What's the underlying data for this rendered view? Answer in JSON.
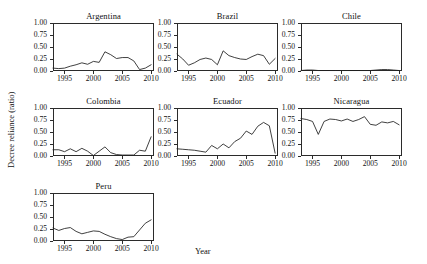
{
  "figure": {
    "xlabel": "Year",
    "ylabel": "Decree reliance (ratio)"
  },
  "chart_data": [
    {
      "type": "line",
      "title": "Argentina",
      "xlabel": "Year",
      "ylabel": "Decree reliance (ratio)",
      "xlim": [
        1993,
        2010.5
      ],
      "ylim": [
        0.0,
        1.0
      ],
      "xticks": [
        1995,
        2000,
        2005,
        2010
      ],
      "yticks": [
        0.0,
        0.25,
        0.5,
        0.75,
        1.0
      ],
      "ytick_labels": [
        "0.00",
        "0.25",
        "0.50",
        "0.75",
        "1.00"
      ],
      "grid": false,
      "legend": "none",
      "x": [
        1993,
        1994,
        1995,
        1996,
        1997,
        1998,
        1999,
        2000,
        2001,
        2002,
        2003,
        2004,
        2005,
        2006,
        2007,
        2008,
        2009,
        2010
      ],
      "values": [
        0.06,
        0.05,
        0.06,
        0.1,
        0.13,
        0.17,
        0.14,
        0.2,
        0.18,
        0.4,
        0.34,
        0.26,
        0.28,
        0.28,
        0.21,
        0.03,
        0.06,
        0.13
      ]
    },
    {
      "type": "line",
      "title": "Brazil",
      "xlabel": "Year",
      "ylabel": "Decree reliance (ratio)",
      "xlim": [
        1993,
        2010.5
      ],
      "ylim": [
        0.0,
        1.0
      ],
      "xticks": [
        1995,
        2000,
        2005,
        2010
      ],
      "yticks": [
        0.0,
        0.25,
        0.5,
        0.75,
        1.0
      ],
      "ytick_labels": [
        "0.00",
        "0.25",
        "0.50",
        "0.75",
        "1.00"
      ],
      "grid": false,
      "legend": "none",
      "x": [
        1993,
        1994,
        1995,
        1996,
        1997,
        1998,
        1999,
        2000,
        2001,
        2002,
        2003,
        2004,
        2005,
        2006,
        2007,
        2008,
        2009,
        2010
      ],
      "values": [
        0.35,
        0.25,
        0.12,
        0.17,
        0.24,
        0.27,
        0.24,
        0.13,
        0.42,
        0.32,
        0.28,
        0.25,
        0.24,
        0.3,
        0.35,
        0.32,
        0.14,
        0.26
      ]
    },
    {
      "type": "line",
      "title": "Chile",
      "xlabel": "Year",
      "ylabel": "Decree reliance (ratio)",
      "xlim": [
        1993,
        2010.5
      ],
      "ylim": [
        0.0,
        1.0
      ],
      "xticks": [
        1995,
        2000,
        2005,
        2010
      ],
      "yticks": [
        0.0,
        0.25,
        0.5,
        0.75,
        1.0
      ],
      "ytick_labels": [
        "0.00",
        "0.25",
        "0.50",
        "0.75",
        "1.00"
      ],
      "grid": false,
      "legend": "none",
      "x": [
        1993,
        1994,
        1995,
        1996,
        1997,
        1998,
        1999,
        2000,
        2001,
        2002,
        2003,
        2004,
        2005,
        2006,
        2007,
        2008,
        2009,
        2010
      ],
      "values": [
        0.01,
        0.02,
        0.02,
        0.01,
        0.01,
        0.01,
        0.01,
        0.01,
        0.01,
        0.01,
        0.01,
        0.01,
        0.01,
        0.02,
        0.03,
        0.03,
        0.02,
        0.01
      ]
    },
    {
      "type": "line",
      "title": "Colombia",
      "xlabel": "Year",
      "ylabel": "Decree reliance (ratio)",
      "xlim": [
        1993,
        2010.5
      ],
      "ylim": [
        0.0,
        1.0
      ],
      "xticks": [
        1995,
        2000,
        2005,
        2010
      ],
      "yticks": [
        0.0,
        0.25,
        0.5,
        0.75,
        1.0
      ],
      "ytick_labels": [
        "0.00",
        "0.25",
        "0.50",
        "0.75",
        "1.00"
      ],
      "grid": false,
      "legend": "none",
      "x": [
        1993,
        1994,
        1995,
        1996,
        1997,
        1998,
        1999,
        2000,
        2001,
        2002,
        2003,
        2004,
        2005,
        2006,
        2007,
        2008,
        2009,
        2010
      ],
      "values": [
        0.13,
        0.13,
        0.09,
        0.15,
        0.09,
        0.16,
        0.1,
        0.01,
        0.1,
        0.19,
        0.07,
        0.03,
        0.02,
        0.02,
        0.02,
        0.12,
        0.1,
        0.4
      ]
    },
    {
      "type": "line",
      "title": "Ecuador",
      "xlabel": "Year",
      "ylabel": "Decree reliance (ratio)",
      "xlim": [
        1993,
        2010.5
      ],
      "ylim": [
        0.0,
        1.0
      ],
      "xticks": [
        1995,
        2000,
        2005,
        2010
      ],
      "yticks": [
        0.0,
        0.25,
        0.5,
        0.75,
        1.0
      ],
      "ytick_labels": [
        "0.00",
        "0.25",
        "0.50",
        "0.75",
        "1.00"
      ],
      "grid": false,
      "legend": "none",
      "x": [
        1993,
        1994,
        1995,
        1996,
        1997,
        1998,
        1999,
        2000,
        2001,
        2002,
        2003,
        2004,
        2005,
        2006,
        2007,
        2008,
        2009,
        2010
      ],
      "values": [
        0.15,
        0.14,
        0.13,
        0.12,
        0.1,
        0.08,
        0.22,
        0.15,
        0.25,
        0.17,
        0.3,
        0.37,
        0.52,
        0.45,
        0.62,
        0.7,
        0.63,
        0.06
      ]
    },
    {
      "type": "line",
      "title": "Nicaragua",
      "xlabel": "Year",
      "ylabel": "Decree reliance (ratio)",
      "xlim": [
        1993,
        2010.5
      ],
      "ylim": [
        0.0,
        1.0
      ],
      "xticks": [
        1995,
        2000,
        2005,
        2010
      ],
      "yticks": [
        0.0,
        0.25,
        0.5,
        0.75,
        1.0
      ],
      "ytick_labels": [
        "0.00",
        "0.25",
        "0.50",
        "0.75",
        "1.00"
      ],
      "grid": false,
      "legend": "none",
      "x": [
        1993,
        1994,
        1995,
        1996,
        1997,
        1998,
        1999,
        2000,
        2001,
        2002,
        2003,
        2004,
        2005,
        2006,
        2007,
        2008,
        2009,
        2010
      ],
      "values": [
        0.78,
        0.76,
        0.72,
        0.45,
        0.72,
        0.77,
        0.76,
        0.73,
        0.77,
        0.72,
        0.76,
        0.82,
        0.66,
        0.64,
        0.71,
        0.69,
        0.72,
        0.65
      ]
    },
    {
      "type": "line",
      "title": "Peru",
      "xlabel": "Year",
      "ylabel": "Decree reliance (ratio)",
      "xlim": [
        1993,
        2010.5
      ],
      "ylim": [
        0.0,
        1.0
      ],
      "xticks": [
        1995,
        2000,
        2005,
        2010
      ],
      "yticks": [
        0.0,
        0.25,
        0.5,
        0.75,
        1.0
      ],
      "ytick_labels": [
        "0.00",
        "0.25",
        "0.50",
        "0.75",
        "1.00"
      ],
      "grid": false,
      "legend": "none",
      "x": [
        1993,
        1994,
        1995,
        1996,
        1997,
        1998,
        1999,
        2000,
        2001,
        2002,
        2003,
        2004,
        2005,
        2006,
        2007,
        2008,
        2009,
        2010
      ],
      "values": [
        0.27,
        0.22,
        0.26,
        0.28,
        0.2,
        0.15,
        0.18,
        0.21,
        0.2,
        0.14,
        0.09,
        0.05,
        0.03,
        0.08,
        0.09,
        0.23,
        0.37,
        0.44
      ]
    }
  ]
}
